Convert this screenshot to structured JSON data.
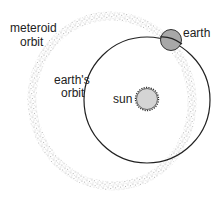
{
  "diagram": {
    "labels": {
      "meteoroid_orbit_line1": "meteroid",
      "meteoroid_orbit_line2": "orbit",
      "earth_orbit_line1": "earth's",
      "earth_orbit_line2": "orbit",
      "sun": "sun",
      "earth": "earth"
    },
    "colors": {
      "orbit_line": "#222222",
      "earth_fill": "#a8a8a8",
      "sun_fill": "#d4d4d4",
      "meteoroid_dots": "#8a8a8a",
      "background": "#ffffff"
    }
  }
}
